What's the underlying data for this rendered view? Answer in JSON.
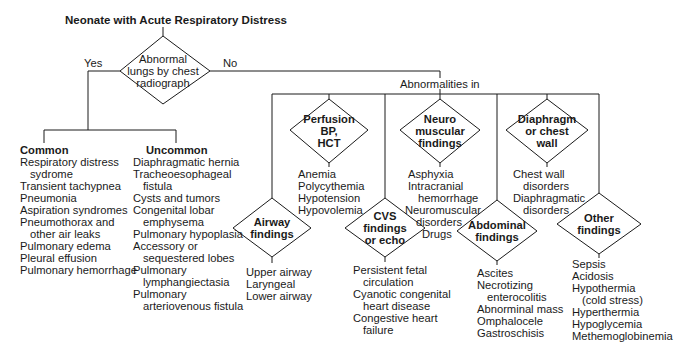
{
  "title": "Neonate with Acute Respiratory Distress",
  "root_decision": {
    "label_lines": [
      "Abnormal",
      "lungs by chest",
      "radiograph"
    ],
    "yes": "Yes",
    "no": "No"
  },
  "yes_branch": {
    "common": {
      "header": "Common",
      "items": [
        [
          "Respiratory distress",
          "sydrome"
        ],
        [
          "Transient tachypnea"
        ],
        [
          "Pneumonia"
        ],
        [
          "Aspiration syndromes"
        ],
        [
          "Pneumothorax and",
          "other air leaks"
        ],
        [
          "Pulmonary edema"
        ],
        [
          "Pleural effusion"
        ],
        [
          "Pulmonary hemorrhage"
        ]
      ]
    },
    "uncommon": {
      "header": "Uncommon",
      "items": [
        [
          "Diaphragmatic hernia"
        ],
        [
          "Tracheoesophageal",
          "fistula"
        ],
        [
          "Cysts and tumors"
        ],
        [
          "Congenital lobar",
          "emphysema"
        ],
        [
          "Pulmonary hypoplasia"
        ],
        [
          "Accessory or",
          "sequestered lobes"
        ],
        [
          "Pulmonary",
          "lymphangiectasia"
        ],
        [
          "Pulmonary",
          "arteriovenous fistula"
        ]
      ]
    }
  },
  "no_branch": {
    "label": "Abnormalities in",
    "categories": [
      {
        "id": "airway",
        "label_lines": [
          "Airway",
          "findings"
        ],
        "items": [
          [
            "Upper airway"
          ],
          [
            "Laryngeal"
          ],
          [
            "Lower airway"
          ]
        ]
      },
      {
        "id": "perfusion",
        "label_lines": [
          "Perfusion",
          "BP,",
          "HCT"
        ],
        "items": [
          [
            "Anemia"
          ],
          [
            "Polycythemia"
          ],
          [
            "Hypotension"
          ],
          [
            "Hypovolemia"
          ]
        ]
      },
      {
        "id": "cvs",
        "label_lines": [
          "CVS",
          "findings",
          "or echo"
        ],
        "items": [
          [
            "Persistent fetal",
            "circulation"
          ],
          [
            "Cyanotic congenital",
            "heart disease"
          ],
          [
            "Congestive heart",
            "failure"
          ]
        ]
      },
      {
        "id": "neuro",
        "label_lines": [
          "Neuro",
          "muscular",
          "findings"
        ],
        "items": [
          [
            "Asphyxia"
          ],
          [
            "Intracranial",
            "hemorrhage"
          ],
          [
            "Neuromuscular",
            "disorders"
          ],
          [
            "Drugs"
          ]
        ]
      },
      {
        "id": "abdominal",
        "label_lines": [
          "Abdominal",
          "findings"
        ],
        "items": [
          [
            "Ascites"
          ],
          [
            "Necrotizing",
            "enterocolitis"
          ],
          [
            "Abnorminal mass"
          ],
          [
            "Omphalocele"
          ],
          [
            "Gastroschisis"
          ]
        ]
      },
      {
        "id": "diaphragm",
        "label_lines": [
          "Diaphragm",
          "or chest",
          "wall"
        ],
        "items": [
          [
            "Chest wall",
            "disorders"
          ],
          [
            "Diaphragmatic",
            "disorders"
          ]
        ]
      },
      {
        "id": "other",
        "label_lines": [
          "Other",
          "findings"
        ],
        "items": [
          [
            "Sepsis"
          ],
          [
            "Acidosis"
          ],
          [
            "Hypothermia",
            "(cold stress)"
          ],
          [
            "Hyperthermia"
          ],
          [
            "Hypoglycemia"
          ],
          [
            "Methemoglobinemia"
          ]
        ]
      }
    ]
  },
  "colors": {
    "line": "#1a1a1a",
    "text": "#1a1a1a",
    "background": "#ffffff"
  }
}
